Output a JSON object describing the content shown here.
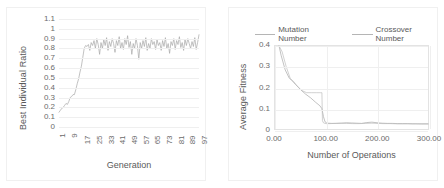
{
  "figure": {
    "background": "#ffffff",
    "panel_border": "#f0f0f0"
  },
  "charts": [
    {
      "id": "best-individual-ratio",
      "type": "line",
      "title": "",
      "xlabel": "Generation",
      "ylabel": "Best Individual Ratio",
      "xlim": [
        1,
        101
      ],
      "ylim": [
        0,
        1.1
      ],
      "grid": "horizontal",
      "legend": null,
      "line_color": "#a8a8a8",
      "yticks": [
        "1.1",
        "1",
        "0.9",
        "0.8",
        "0.7",
        "0.6",
        "0.5",
        "0.4",
        "0.3",
        "0.2",
        "0.1",
        "0"
      ],
      "xticks": [
        "1",
        "9",
        "17",
        "25",
        "33",
        "41",
        "49",
        "57",
        "65",
        "73",
        "81",
        "89",
        "97"
      ],
      "series": [
        {
          "name": "Best Individual Ratio",
          "x": [
            1,
            2,
            3,
            4,
            5,
            6,
            7,
            8,
            9,
            10,
            11,
            12,
            13,
            14,
            15,
            16,
            17,
            18,
            19,
            20,
            21,
            22,
            23,
            24,
            25,
            26,
            27,
            28,
            29,
            30,
            31,
            32,
            33,
            34,
            35,
            36,
            37,
            38,
            39,
            40,
            41,
            42,
            43,
            44,
            45,
            46,
            47,
            48,
            49,
            50,
            51,
            52,
            53,
            54,
            55,
            56,
            57,
            58,
            59,
            60,
            61,
            62,
            63,
            64,
            65,
            66,
            67,
            68,
            69,
            70,
            71,
            72,
            73,
            74,
            75,
            76,
            77,
            78,
            79,
            80,
            81,
            82,
            83,
            84,
            85,
            86,
            87,
            88,
            89,
            90,
            91,
            92,
            93,
            94,
            95,
            96,
            97,
            98,
            99,
            100,
            101
          ],
          "y": [
            0.15,
            0.17,
            0.19,
            0.2,
            0.22,
            0.24,
            0.23,
            0.26,
            0.3,
            0.31,
            0.33,
            0.33,
            0.38,
            0.44,
            0.49,
            0.56,
            0.62,
            0.71,
            0.8,
            0.83,
            0.82,
            0.84,
            0.78,
            0.86,
            0.83,
            0.88,
            0.8,
            0.9,
            0.84,
            0.74,
            0.86,
            0.8,
            0.89,
            0.83,
            0.91,
            0.78,
            0.87,
            0.82,
            0.9,
            0.85,
            0.76,
            0.88,
            0.83,
            0.92,
            0.8,
            0.86,
            0.79,
            0.9,
            0.84,
            0.93,
            0.81,
            0.87,
            0.74,
            0.85,
            0.8,
            0.9,
            0.83,
            0.69,
            0.86,
            0.8,
            0.88,
            0.82,
            0.91,
            0.78,
            0.85,
            0.8,
            0.9,
            0.84,
            0.87,
            0.79,
            0.89,
            0.83,
            0.86,
            0.78,
            0.88,
            0.82,
            0.91,
            0.8,
            0.85,
            0.75,
            0.87,
            0.83,
            0.9,
            0.79,
            0.88,
            0.84,
            0.92,
            0.81,
            0.86,
            0.78,
            0.89,
            0.83,
            0.9,
            0.85,
            0.8,
            0.87,
            0.82,
            0.91,
            0.79,
            0.86,
            0.94
          ]
        }
      ]
    },
    {
      "id": "average-fitness",
      "type": "line",
      "title": "",
      "xlabel": "Number of Operations",
      "ylabel": "Average Fitness",
      "xlim": [
        0,
        300
      ],
      "ylim": [
        0,
        0.4
      ],
      "grid": "both",
      "legend": {
        "position": "top",
        "entries": [
          "Mutation Number",
          "Crossover Number"
        ]
      },
      "yticks": [
        "0.4",
        "0.3",
        "0.2",
        "0.1",
        "0"
      ],
      "xticks": [
        "0.00",
        "100.00",
        "200.00",
        "300.00"
      ],
      "series": [
        {
          "name": "Mutation Number",
          "color": "#a8a8a8",
          "x": [
            8,
            12,
            20,
            28,
            34,
            40,
            50,
            60,
            70,
            80,
            88,
            92,
            95,
            98,
            101,
            104,
            110,
            120,
            130,
            140,
            150,
            160,
            170,
            180,
            190,
            200,
            210,
            220,
            230,
            240,
            250,
            260,
            270,
            280,
            290,
            300
          ],
          "y": [
            0.4,
            0.355,
            0.285,
            0.245,
            0.232,
            0.215,
            0.19,
            0.168,
            0.15,
            0.128,
            0.112,
            0.098,
            0.06,
            0.035,
            0.03,
            0.028,
            0.027,
            0.027,
            0.028,
            0.03,
            0.029,
            0.028,
            0.027,
            0.031,
            0.033,
            0.03,
            0.028,
            0.027,
            0.027,
            0.026,
            0.026,
            0.026,
            0.025,
            0.025,
            0.025,
            0.025
          ]
        },
        {
          "name": "Crossover Number",
          "color": "#bdbdbd",
          "x": [
            8,
            14,
            22,
            30,
            36,
            42,
            52,
            62,
            72,
            82,
            88,
            89,
            92,
            93,
            95,
            98,
            101,
            108,
            118,
            128,
            140,
            152,
            165,
            178,
            190,
            200,
            212,
            225,
            238,
            250,
            262,
            275,
            288,
            300
          ],
          "y": [
            0.4,
            0.372,
            0.3,
            0.243,
            0.23,
            0.212,
            0.186,
            0.175,
            0.175,
            0.175,
            0.175,
            0.175,
            0.175,
            0.04,
            0.03,
            0.027,
            0.026,
            0.026,
            0.027,
            0.028,
            0.027,
            0.026,
            0.026,
            0.027,
            0.028,
            0.027,
            0.026,
            0.026,
            0.025,
            0.025,
            0.025,
            0.025,
            0.024,
            0.024
          ]
        }
      ]
    }
  ]
}
